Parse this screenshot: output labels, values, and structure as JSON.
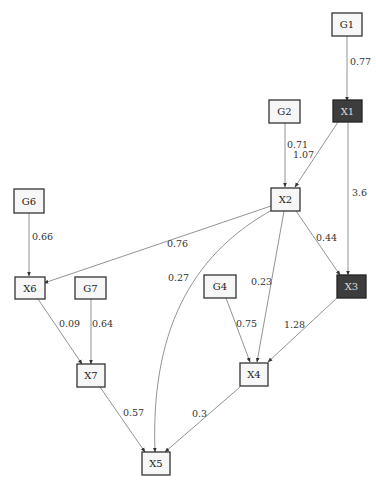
{
  "diagram": {
    "type": "path-diagram",
    "nodes": [
      {
        "id": "G1",
        "label": "G1",
        "style": "light"
      },
      {
        "id": "X1",
        "label": "X1",
        "style": "dark"
      },
      {
        "id": "G2",
        "label": "G2",
        "style": "light"
      },
      {
        "id": "X2",
        "label": "X2",
        "style": "light"
      },
      {
        "id": "G6",
        "label": "G6",
        "style": "light"
      },
      {
        "id": "X6",
        "label": "X6",
        "style": "light"
      },
      {
        "id": "G7",
        "label": "G7",
        "style": "light"
      },
      {
        "id": "G4",
        "label": "G4",
        "style": "light"
      },
      {
        "id": "X3",
        "label": "X3",
        "style": "dark"
      },
      {
        "id": "X7",
        "label": "X7",
        "style": "light"
      },
      {
        "id": "X4",
        "label": "X4",
        "style": "light"
      },
      {
        "id": "X5",
        "label": "X5",
        "style": "light"
      }
    ],
    "edges": [
      {
        "from": "G1",
        "to": "X1",
        "weight": "0.77"
      },
      {
        "from": "G2",
        "to": "X2",
        "weight": "0.71"
      },
      {
        "from": "X1",
        "to": "X2",
        "weight": "1.07"
      },
      {
        "from": "X1",
        "to": "X3",
        "weight": "3.6"
      },
      {
        "from": "G6",
        "to": "X6",
        "weight": "0.66"
      },
      {
        "from": "X2",
        "to": "X6",
        "weight": "0.76"
      },
      {
        "from": "X2",
        "to": "X5",
        "weight": "0.27"
      },
      {
        "from": "X2",
        "to": "X4",
        "weight": "0.23"
      },
      {
        "from": "X2",
        "to": "X3",
        "weight": "0.44"
      },
      {
        "from": "X6",
        "to": "X7",
        "weight": "0.09"
      },
      {
        "from": "G7",
        "to": "X7",
        "weight": "0.64"
      },
      {
        "from": "G4",
        "to": "X4",
        "weight": "0.75"
      },
      {
        "from": "X3",
        "to": "X4",
        "weight": "1.28"
      },
      {
        "from": "X7",
        "to": "X5",
        "weight": "0.57"
      },
      {
        "from": "X4",
        "to": "X5",
        "weight": "0.3"
      }
    ]
  },
  "colors": {
    "light_node_fill": "#f7f7f7",
    "dark_node_fill": "#3d3d3d",
    "edge": "#777777"
  }
}
